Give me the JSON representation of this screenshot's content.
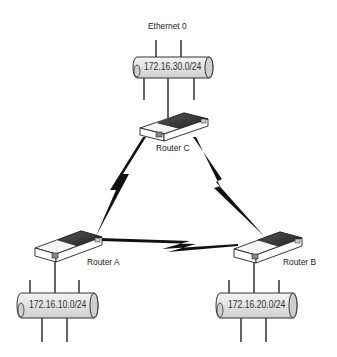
{
  "diagram": {
    "title_label": "Ethernet 0",
    "networks": [
      {
        "id": "net-c",
        "subnet": "172.16.30.0/24"
      },
      {
        "id": "net-a",
        "subnet": "172.16.10.0/24"
      },
      {
        "id": "net-b",
        "subnet": "172.16.20.0/24"
      }
    ],
    "routers": [
      {
        "id": "router-c",
        "label": "Router  C"
      },
      {
        "id": "router-a",
        "label": "Router  A"
      },
      {
        "id": "router-b",
        "label": "Router  B"
      }
    ],
    "links": [
      {
        "from": "Router C",
        "to": "Router A",
        "type": "serial"
      },
      {
        "from": "Router C",
        "to": "Router B",
        "type": "serial"
      },
      {
        "from": "Router A",
        "to": "Router B",
        "type": "serial"
      }
    ],
    "colors": {
      "pipe_fill": "#e6e6e6",
      "pipe_stroke": "#333333",
      "router_dark": "#3a3a3a",
      "line": "#111111"
    }
  }
}
